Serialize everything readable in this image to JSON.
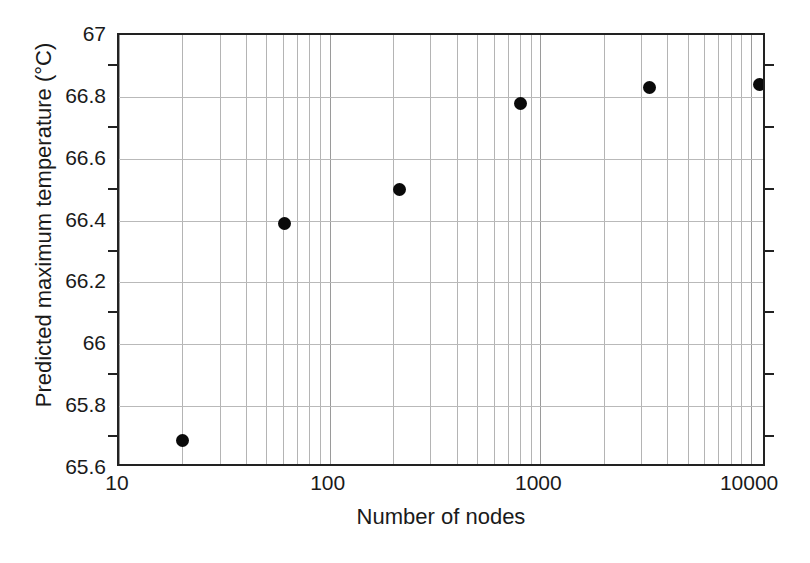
{
  "chart_data": {
    "type": "scatter",
    "title": "",
    "xlabel": "Number of nodes",
    "ylabel": "Predicted maximum temperature (°C)",
    "xscale": "log",
    "yscale": "linear",
    "xlim": [
      10,
      11900
    ],
    "ylim": [
      65.6,
      67
    ],
    "grid": true,
    "legend": null,
    "marker": "filled-circle",
    "marker_color": "#0a0a0a",
    "x": [
      20,
      61,
      215,
      807,
      3290,
      11000
    ],
    "y": [
      65.69,
      66.39,
      66.5,
      66.78,
      66.83,
      66.84
    ],
    "points": [
      {
        "x": 20,
        "y": 65.69
      },
      {
        "x": 61,
        "y": 66.39
      },
      {
        "x": 215,
        "y": 66.5
      },
      {
        "x": 807,
        "y": 66.78
      },
      {
        "x": 3290,
        "y": 66.83
      },
      {
        "x": 11000,
        "y": 66.84
      }
    ],
    "xticks": [
      {
        "value": 10,
        "label": "10"
      },
      {
        "value": 100,
        "label": "100"
      },
      {
        "value": 1000,
        "label": "1000"
      },
      {
        "value": 10000,
        "label": "10000"
      }
    ],
    "yticks": [
      {
        "value": 67,
        "label": "67"
      },
      {
        "value": 66.8,
        "label": "66.8"
      },
      {
        "value": 66.6,
        "label": "66.6"
      },
      {
        "value": 66.4,
        "label": "66.4"
      },
      {
        "value": 66.2,
        "label": "66.2"
      },
      {
        "value": 66,
        "label": "66"
      },
      {
        "value": 65.8,
        "label": "65.8"
      },
      {
        "value": 65.6,
        "label": "65.6"
      }
    ],
    "yminorticks": [
      66.9,
      66.7,
      66.5,
      66.3,
      66.1,
      65.9,
      65.7
    ]
  },
  "axes": {
    "x_title": "Number of nodes",
    "y_title": "Predicted maximum temperature (°C)"
  },
  "colors": {
    "marker": "#0a0a0a",
    "frame": "#222222",
    "grid_major": "#9a9a9a",
    "grid_minor": "#b4b4b4",
    "background": "#ffffff"
  }
}
